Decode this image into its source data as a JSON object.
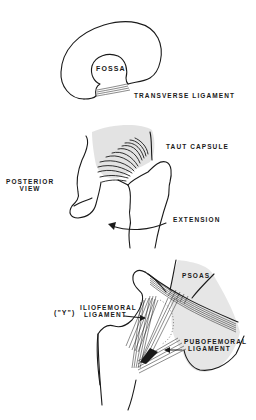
{
  "figures": [
    {
      "id": "acetabulum",
      "labels": {
        "fossa": "FOSSA",
        "transverse_ligament": "TRANSVERSE LIGAMENT"
      }
    },
    {
      "id": "posterior-view",
      "labels": {
        "view": "POSTERIOR\nVIEW",
        "view_line1": "POSTERIOR",
        "view_line2": "VIEW",
        "taut_capsule": "TAUT CAPSULE",
        "extension": "EXTENSION"
      }
    },
    {
      "id": "anterior-ligaments",
      "labels": {
        "psoas": "PSOAS",
        "iliofemoral_prefix": "(\"Y\")",
        "iliofemoral_line1": "ILIOFEMORAL",
        "iliofemoral_line2": "LIGAMENT",
        "pubofemoral_line1": "PUBOFEMORAL",
        "pubofemoral_line2": "LIGAMENT"
      }
    }
  ],
  "colors": {
    "ink": "#1a1a1a",
    "shading": "#d9d9d9",
    "background": "#ffffff"
  }
}
